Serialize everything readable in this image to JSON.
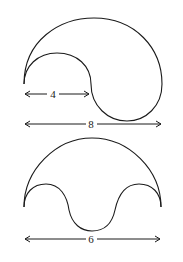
{
  "figures": [
    {
      "name": "spiral-shape",
      "dimensions": [
        {
          "label": "4"
        },
        {
          "label": "8"
        }
      ]
    },
    {
      "name": "arch-shape",
      "dimensions": [
        {
          "label": "6"
        }
      ]
    }
  ]
}
